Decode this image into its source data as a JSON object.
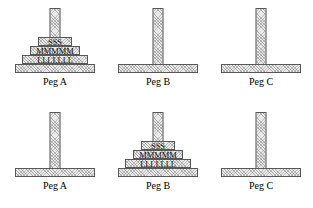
{
  "diagram": {
    "rows": [
      {
        "name": "initial-state",
        "pegs": [
          {
            "label": "Peg A",
            "disks": [
              {
                "size": "small",
                "text": "SSS"
              },
              {
                "size": "medium",
                "text": "MMMMM"
              },
              {
                "size": "large",
                "text": "LLLLLLL"
              }
            ]
          },
          {
            "label": "Peg B",
            "disks": []
          },
          {
            "label": "Peg C",
            "disks": []
          }
        ]
      },
      {
        "name": "goal-state",
        "pegs": [
          {
            "label": "Peg A",
            "disks": []
          },
          {
            "label": "Peg B",
            "disks": [
              {
                "size": "small",
                "text": "SSS"
              },
              {
                "size": "medium",
                "text": "MMMMM"
              },
              {
                "size": "large",
                "text": "LLLLLLL"
              }
            ]
          },
          {
            "label": "Peg C",
            "disks": []
          }
        ]
      }
    ]
  },
  "colors": {
    "fill": "#e9e9e9",
    "stroke": "#575757",
    "text": "#000000",
    "background": "#ffffff"
  }
}
